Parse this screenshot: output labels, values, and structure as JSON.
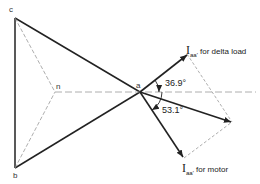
{
  "diagram": {
    "type": "phasor-diagram",
    "vertices": {
      "a": "a",
      "b": "b",
      "c": "c",
      "n": "n"
    },
    "currents": {
      "delta": {
        "symbol": "I",
        "subscript": "aa'",
        "caption": "for delta load"
      },
      "motor": {
        "symbol": "I",
        "subscript": "aa'",
        "caption": "for motor"
      }
    },
    "angles": {
      "delta": "36.9°",
      "motor": "53.1°"
    },
    "colors": {
      "solid_line": "#222222",
      "dashed_line": "#888888"
    }
  }
}
